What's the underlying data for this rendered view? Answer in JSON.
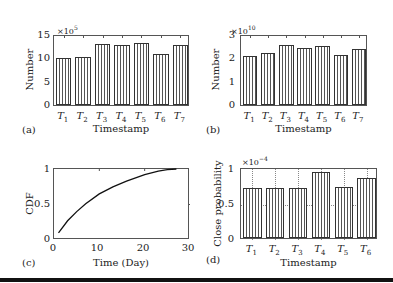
{
  "chart_data": [
    {
      "panel": "(a)",
      "type": "bar",
      "title": "",
      "xlabel": "Timestamp",
      "ylabel": "Number",
      "y_multiplier": "×10^5",
      "categories": [
        "T1",
        "T2",
        "T3",
        "T4",
        "T5",
        "T6",
        "T7"
      ],
      "values": [
        10.3,
        10.5,
        13.3,
        13.0,
        13.5,
        11.1,
        13.1
      ],
      "ylim": [
        0,
        15
      ],
      "yticks": [
        "0",
        "5",
        "10",
        "15"
      ],
      "grid": false,
      "legend": null
    },
    {
      "panel": "(b)",
      "type": "bar",
      "title": "",
      "xlabel": "Timestamp",
      "ylabel": "Number",
      "y_multiplier": "×10^10",
      "categories": [
        "T1",
        "T2",
        "T3",
        "T4",
        "T5",
        "T6",
        "T7"
      ],
      "values": [
        2.15,
        2.24,
        2.62,
        2.49,
        2.57,
        2.16,
        2.42
      ],
      "ylim": [
        0,
        3
      ],
      "yticks": [
        "0",
        "1",
        "2",
        "3"
      ],
      "grid": false,
      "legend": null
    },
    {
      "panel": "(c)",
      "type": "line",
      "title": "",
      "xlabel": "Time (Day)",
      "ylabel": "CDF",
      "x": [
        1,
        3,
        5,
        7,
        10,
        13,
        16,
        20,
        23,
        25,
        27
      ],
      "y": [
        0.1,
        0.27,
        0.4,
        0.51,
        0.65,
        0.75,
        0.83,
        0.92,
        0.97,
        0.99,
        1.0
      ],
      "xlim": [
        0,
        30
      ],
      "ylim": [
        0,
        1
      ],
      "xticks": [
        "0",
        "10",
        "20",
        "30"
      ],
      "yticks": [
        "0",
        "0.5",
        "1"
      ],
      "grid": false,
      "legend": null
    },
    {
      "panel": "(d)",
      "type": "bar",
      "title": "",
      "xlabel": "Timestamp",
      "ylabel": "Close probability",
      "y_multiplier": "×10^-4",
      "categories": [
        "T1",
        "T2",
        "T3",
        "T4",
        "T5",
        "T6"
      ],
      "values": [
        0.73,
        0.72,
        0.73,
        0.96,
        0.74,
        0.87
      ],
      "ylim": [
        0,
        1
      ],
      "yticks": [
        "0",
        "0.5",
        "1"
      ],
      "grid": true,
      "legend": null
    }
  ],
  "panels": {
    "a": {
      "label": "(a)",
      "xlabel": "Timestamp",
      "ylabel": "Number",
      "exp_base": "×10",
      "exp_power": "5",
      "yticks": [
        "15",
        "10",
        "5",
        "0"
      ],
      "xticks": [
        {
          "t": "T",
          "s": "1"
        },
        {
          "t": "T",
          "s": "2"
        },
        {
          "t": "T",
          "s": "3"
        },
        {
          "t": "T",
          "s": "4"
        },
        {
          "t": "T",
          "s": "5"
        },
        {
          "t": "T",
          "s": "6"
        },
        {
          "t": "T",
          "s": "7"
        }
      ]
    },
    "b": {
      "label": "(b)",
      "xlabel": "Timestamp",
      "ylabel": "Number",
      "exp_base": "×10",
      "exp_power": "10",
      "yticks": [
        "3",
        "2",
        "1",
        "0"
      ]
    },
    "c": {
      "label": "(c)",
      "xlabel": "Time (Day)",
      "ylabel": "CDF",
      "yticks": [
        "1",
        "0.5",
        "0"
      ],
      "xticks": [
        "0",
        "10",
        "20",
        "30"
      ]
    },
    "d": {
      "label": "(d)",
      "xlabel": "Timestamp",
      "ylabel": "Close probability",
      "exp_base": "×10",
      "exp_power": "−4",
      "yticks": [
        "1",
        "0.5",
        "0"
      ]
    }
  }
}
